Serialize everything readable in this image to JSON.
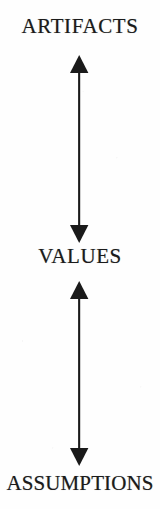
{
  "figure": {
    "type": "three-level-vertical-diagram",
    "background_color": "#fefefe",
    "ink_color": "#1a1a1a",
    "width": 160,
    "height": 509
  },
  "levels": [
    {
      "id": "artifacts",
      "label": "ARTIFACTS"
    },
    {
      "id": "values",
      "label": "VALUES"
    },
    {
      "id": "assumptions",
      "label": "ASSUMPTIONS"
    }
  ],
  "connectors": [
    {
      "id": "artifacts-values",
      "icon": "double-headed-vertical-arrow",
      "from": "ARTIFACTS",
      "to": "VALUES",
      "direction": "bidirectional"
    },
    {
      "id": "values-assumptions",
      "icon": "double-headed-vertical-arrow",
      "from": "VALUES",
      "to": "ASSUMPTIONS",
      "direction": "bidirectional"
    }
  ]
}
